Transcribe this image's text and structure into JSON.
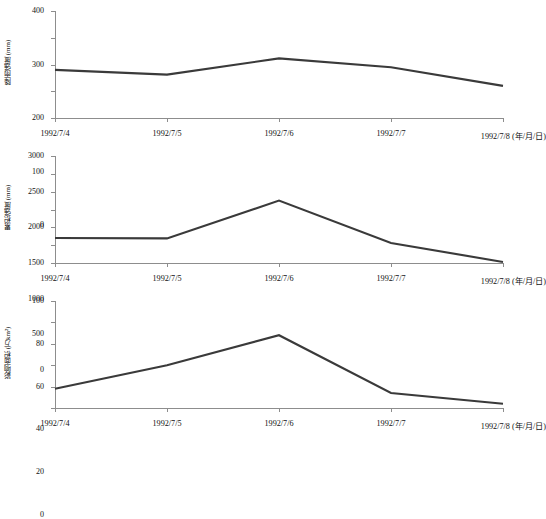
{
  "figure": {
    "background": "#ffffff",
    "line_color": "#3a3a3a",
    "axis_color": "#8d8d8d"
  },
  "chart_data": [
    {
      "type": "line",
      "title": "",
      "xlabel": "(年/月/日)",
      "ylabel": "降雨强度 (mm)",
      "categories": [
        "1992/7/4",
        "1992/7/5",
        "1992/7/6",
        "1992/7/7",
        "1992/7/8"
      ],
      "values": [
        180,
        162,
        223,
        190,
        120
      ],
      "ylim": [
        0,
        400
      ],
      "yticks": [
        0,
        100,
        200,
        300,
        400
      ],
      "grid": false,
      "legend": "none"
    },
    {
      "type": "line",
      "title": "",
      "xlabel": "(年/月/日)",
      "ylabel": "累积强度 (mm)",
      "categories": [
        "1992/7/4",
        "1992/7/5",
        "1992/7/6",
        "1992/7/7",
        "1992/7/8"
      ],
      "values": [
        700,
        690,
        1750,
        560,
        30
      ],
      "ylim": [
        0,
        3000
      ],
      "yticks": [
        0,
        500,
        1000,
        1500,
        2000,
        2500,
        3000
      ],
      "grid": false,
      "legend": "none"
    },
    {
      "type": "line",
      "title": "",
      "xlabel": "(年/月/日)",
      "ylabel": "影响面积 (万km²)",
      "categories": [
        "1992/7/4",
        "1992/7/5",
        "1992/7/6",
        "1992/7/7",
        "1992/7/8"
      ],
      "values": [
        18,
        40,
        68,
        14,
        4
      ],
      "ylim": [
        0,
        100
      ],
      "yticks": [
        0,
        20,
        40,
        60,
        80,
        100
      ],
      "grid": false,
      "legend": "none"
    }
  ],
  "axis_suffix": "(年/月/日)"
}
